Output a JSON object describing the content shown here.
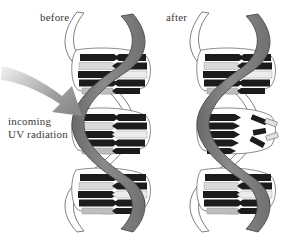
{
  "figure": {
    "title_before": "before",
    "title_after": "after",
    "annotation": {
      "line1": "incoming",
      "line2": "UV radiation"
    },
    "background_color": "#ffffff",
    "colors": {
      "ribbon_front": "#808080",
      "ribbon_front_shade": "#6e6e6e",
      "ribbon_back": "#ffffff",
      "outline": "#4a4a4a",
      "base_dark": "#1a1a1a",
      "base_light": "#e8e8e8",
      "base_mid": "#c0c0c0",
      "arrow": "#9a9a9a",
      "text": "#3a3a3a"
    },
    "diagram_type": "dna-uv-damage-illustration",
    "panels": [
      {
        "name": "before",
        "label": "before",
        "state": "intact",
        "rung_groups": 3,
        "damaged": false
      },
      {
        "name": "after",
        "label": "after",
        "state": "damaged",
        "rung_groups": 3,
        "damaged": true,
        "damage_location": "middle",
        "damage_description": "broken base pairs with detached fragments"
      }
    ],
    "arrow": {
      "name": "uv-radiation-arrow",
      "direction": "down-right",
      "points_to": "before-helix-middle"
    }
  }
}
